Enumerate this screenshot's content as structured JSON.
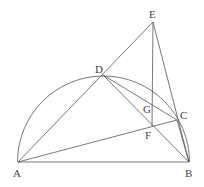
{
  "diagram": {
    "points": {
      "A": {
        "label": "A",
        "x": 18,
        "y": 162,
        "lx": 13,
        "ly": 177
      },
      "B": {
        "label": "B",
        "x": 189,
        "y": 162,
        "lx": 185,
        "ly": 177
      },
      "C": {
        "label": "C",
        "x": 177,
        "y": 120,
        "lx": 180,
        "ly": 119
      },
      "D": {
        "label": "D",
        "x": 103,
        "y": 75,
        "lx": 95,
        "ly": 73
      },
      "E": {
        "label": "E",
        "x": 153,
        "y": 22,
        "lx": 149,
        "ly": 18
      },
      "F": {
        "label": "F",
        "x": 152,
        "y": 126,
        "lx": 145,
        "ly": 139
      },
      "G": {
        "label": "G",
        "lx": 143,
        "ly": 113
      }
    },
    "semicircle": {
      "cx": 103.5,
      "cy": 162,
      "r": 86
    }
  }
}
